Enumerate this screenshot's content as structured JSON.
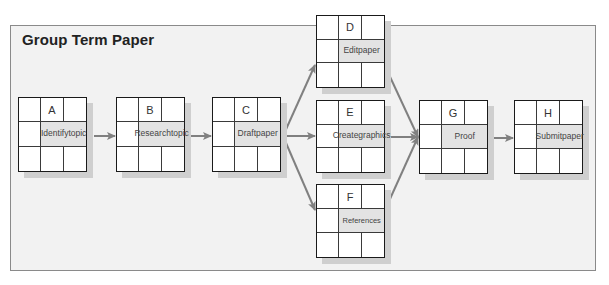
{
  "title": "Group Term Paper",
  "colors": {
    "panel_bg": "#f2f2f2",
    "panel_border": "#8a8a8a",
    "node_border": "#1a1a1a",
    "node_desc_bg": "#e3e3e3",
    "arrow": "#808080",
    "shadow": "#cfcfcf"
  },
  "nodes": [
    {
      "id": "A",
      "label": "Identify topic",
      "line1": "Identify",
      "line2": "topic"
    },
    {
      "id": "B",
      "label": "Research topic",
      "line1": "Research",
      "line2": "topic"
    },
    {
      "id": "C",
      "label": "Draft paper",
      "line1": "Draft",
      "line2": "paper"
    },
    {
      "id": "D",
      "label": "Edit paper",
      "line1": "Edit",
      "line2": "paper"
    },
    {
      "id": "E",
      "label": "Create graphics",
      "line1": "Create",
      "line2": "graphics"
    },
    {
      "id": "F",
      "label": "References",
      "line1": "References",
      "line2": ""
    },
    {
      "id": "G",
      "label": "Proof",
      "line1": "Proof",
      "line2": ""
    },
    {
      "id": "H",
      "label": "Submit paper",
      "line1": "Submit",
      "line2": "paper"
    }
  ],
  "edges": [
    {
      "from": "A",
      "to": "B"
    },
    {
      "from": "B",
      "to": "C"
    },
    {
      "from": "C",
      "to": "D"
    },
    {
      "from": "C",
      "to": "E"
    },
    {
      "from": "C",
      "to": "F"
    },
    {
      "from": "D",
      "to": "G"
    },
    {
      "from": "E",
      "to": "G"
    },
    {
      "from": "F",
      "to": "G"
    },
    {
      "from": "G",
      "to": "H"
    }
  ]
}
